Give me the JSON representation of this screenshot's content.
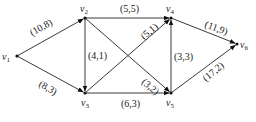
{
  "diagram": {
    "type": "directed-network-flow",
    "nodes": [
      {
        "id": "v1",
        "name": "v",
        "sub": "1",
        "x": 17,
        "y": 56,
        "lx": 2,
        "ly": 60
      },
      {
        "id": "v2",
        "name": "v",
        "sub": "2",
        "x": 85,
        "y": 18,
        "lx": 80,
        "ly": 12
      },
      {
        "id": "v3",
        "name": "v",
        "sub": "3",
        "x": 85,
        "y": 93,
        "lx": 81,
        "ly": 106
      },
      {
        "id": "v4",
        "name": "v",
        "sub": "4",
        "x": 171,
        "y": 18,
        "lx": 166,
        "ly": 12
      },
      {
        "id": "v5",
        "name": "v",
        "sub": "5",
        "x": 171,
        "y": 93,
        "lx": 166,
        "ly": 106
      },
      {
        "id": "v6",
        "name": "v",
        "sub": "6",
        "x": 237,
        "y": 44,
        "lx": 240,
        "ly": 48
      }
    ],
    "edges": [
      {
        "from": "v1",
        "to": "v2",
        "label": "(10,8)",
        "lx": 32,
        "ly": 36,
        "rot": -29
      },
      {
        "from": "v1",
        "to": "v3",
        "label": "(8,3)",
        "lx": 38,
        "ly": 86,
        "rot": 29
      },
      {
        "from": "v2",
        "to": "v3",
        "label": "(4,1)",
        "lx": 88,
        "ly": 59,
        "rot": 0
      },
      {
        "from": "v2",
        "to": "v4",
        "label": "(5,5)",
        "lx": 120,
        "ly": 12,
        "rot": 0
      },
      {
        "from": "v2",
        "to": "v5",
        "label": "(3,2)",
        "lx": 141,
        "ly": 83,
        "rot": 40
      },
      {
        "from": "v3",
        "to": "v4",
        "label": "(5,1)",
        "lx": 144,
        "ly": 40,
        "rot": -40
      },
      {
        "from": "v3",
        "to": "v5",
        "label": "(6,3)",
        "lx": 121,
        "ly": 107,
        "rot": 0
      },
      {
        "from": "v5",
        "to": "v4",
        "label": "(3,3)",
        "lx": 174,
        "ly": 60,
        "rot": 0
      },
      {
        "from": "v4",
        "to": "v6",
        "label": "(11,9)",
        "lx": 204,
        "ly": 27,
        "rot": 20
      },
      {
        "from": "v5",
        "to": "v6",
        "label": "(17,2)",
        "lx": 206,
        "ly": 82,
        "rot": -40
      }
    ],
    "colors": {
      "edge": "#3a3a3a",
      "node": "#111111",
      "text": "#222222",
      "background": "#ffffff"
    }
  }
}
